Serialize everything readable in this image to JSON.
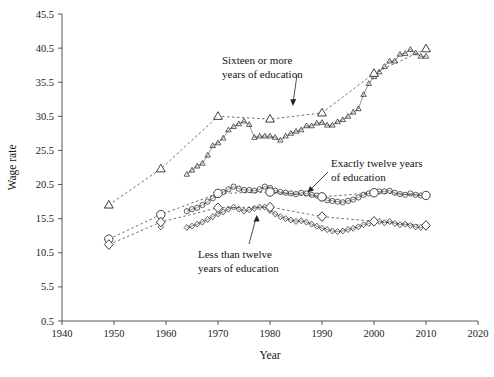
{
  "chart_data": {
    "type": "line",
    "title": "",
    "xlabel": "Year",
    "ylabel": "Wage rate",
    "xlim": [
      1940,
      2020
    ],
    "ylim": [
      0.5,
      45.5
    ],
    "xticks": [
      1940,
      1950,
      1960,
      1970,
      1980,
      1990,
      2000,
      2010,
      2020
    ],
    "yticks": [
      0.5,
      5.5,
      10.5,
      15.5,
      20.5,
      25.5,
      30.5,
      35.5,
      40.5,
      45.5
    ],
    "grid": false,
    "legend_position": "inline-annotations",
    "annotations": [
      {
        "name": "sixteen-or-more",
        "text_line1": "Sixteen or more",
        "text_line2": "years of education",
        "points_to": "triangle-series"
      },
      {
        "name": "exactly-twelve",
        "text_line1": "Exactly twelve years",
        "text_line2": "of education",
        "points_to": "circle-series"
      },
      {
        "name": "less-than-twelve",
        "text_line1": "Less than twelve",
        "text_line2": "years of education",
        "points_to": "diamond-series"
      }
    ],
    "series": [
      {
        "name": "Sixteen or more years of education",
        "marker": "triangle",
        "style": "dense-annual-with-decade-markers",
        "x": [
          1949,
          1959,
          1964,
          1965,
          1966,
          1967,
          1968,
          1969,
          1970,
          1971,
          1972,
          1973,
          1974,
          1975,
          1976,
          1977,
          1978,
          1979,
          1980,
          1981,
          1982,
          1983,
          1984,
          1985,
          1986,
          1987,
          1988,
          1989,
          1990,
          1991,
          1992,
          1993,
          1994,
          1995,
          1996,
          1997,
          1998,
          1999,
          2000,
          2001,
          2002,
          2003,
          2004,
          2005,
          2006,
          2007,
          2008,
          2009,
          2010
        ],
        "y": [
          17.5,
          22.7,
          22.0,
          22.6,
          23.2,
          23.6,
          24.8,
          26.2,
          26.6,
          27.3,
          28.5,
          29.0,
          29.4,
          29.8,
          29.3,
          27.4,
          27.6,
          27.6,
          27.6,
          27.4,
          27.0,
          27.6,
          28.0,
          28.3,
          28.5,
          29.1,
          29.1,
          29.5,
          29.6,
          29.2,
          29.2,
          29.7,
          30.0,
          30.5,
          31.1,
          31.6,
          33.7,
          35.3,
          36.3,
          37.0,
          37.8,
          38.6,
          38.6,
          39.6,
          39.7,
          40.3,
          39.8,
          39.3,
          39.3
        ],
        "decade_x": [
          1949,
          1959,
          1970,
          1980,
          1990,
          2000,
          2010
        ],
        "decade_y": [
          17.5,
          22.8,
          30.5,
          30.1,
          31.0,
          36.8,
          40.4
        ]
      },
      {
        "name": "Exactly twelve years of education",
        "marker": "circle",
        "style": "dense-annual-with-decade-markers",
        "x": [
          1949,
          1959,
          1964,
          1965,
          1966,
          1967,
          1968,
          1969,
          1970,
          1971,
          1972,
          1973,
          1974,
          1975,
          1976,
          1977,
          1978,
          1979,
          1980,
          1981,
          1982,
          1983,
          1984,
          1985,
          1986,
          1987,
          1988,
          1989,
          1990,
          1991,
          1992,
          1993,
          1994,
          1995,
          1996,
          1997,
          1998,
          1999,
          2000,
          2001,
          2002,
          2003,
          2004,
          2005,
          2006,
          2007,
          2008,
          2009,
          2010
        ],
        "y": [
          12.5,
          15.8,
          16.6,
          16.9,
          17.1,
          17.5,
          18.0,
          18.5,
          19.0,
          19.4,
          19.8,
          20.2,
          19.9,
          19.7,
          19.7,
          19.6,
          19.8,
          20.2,
          20.0,
          19.6,
          19.4,
          19.3,
          19.2,
          19.1,
          19.3,
          19.2,
          19.0,
          18.9,
          18.5,
          18.2,
          18.1,
          18.0,
          17.9,
          18.1,
          18.3,
          18.6,
          19.0,
          19.2,
          19.4,
          19.5,
          19.5,
          19.6,
          19.3,
          19.1,
          19.0,
          19.2,
          19.0,
          18.9,
          18.8
        ],
        "decade_x": [
          1949,
          1959,
          1970,
          1980,
          1990,
          2000,
          2010
        ],
        "decade_y": [
          12.5,
          16.1,
          19.2,
          19.4,
          18.7,
          19.3,
          18.9
        ]
      },
      {
        "name": "Less than twelve years of education",
        "marker": "diamond",
        "style": "dense-annual-with-decade-markers",
        "x": [
          1949,
          1959,
          1964,
          1965,
          1966,
          1967,
          1968,
          1969,
          1970,
          1971,
          1972,
          1973,
          1974,
          1975,
          1976,
          1977,
          1978,
          1979,
          1980,
          1981,
          1982,
          1983,
          1984,
          1985,
          1986,
          1987,
          1988,
          1989,
          1990,
          1991,
          1992,
          1993,
          1994,
          1995,
          1996,
          1997,
          1998,
          1999,
          2000,
          2001,
          2002,
          2003,
          2004,
          2005,
          2006,
          2007,
          2008,
          2009,
          2010
        ],
        "y": [
          11.8,
          14.3,
          14.2,
          14.4,
          14.7,
          15.0,
          15.4,
          15.8,
          16.2,
          16.5,
          16.9,
          17.2,
          16.9,
          16.6,
          16.8,
          17.0,
          17.2,
          17.2,
          16.7,
          16.2,
          15.8,
          15.5,
          15.3,
          15.1,
          15.2,
          15.0,
          14.7,
          14.4,
          14.1,
          13.9,
          13.7,
          13.6,
          13.7,
          13.9,
          14.1,
          14.3,
          14.6,
          14.8,
          15.0,
          15.1,
          14.9,
          15.1,
          14.8,
          14.6,
          14.7,
          14.5,
          14.3,
          14.2,
          14.3
        ],
        "decade_x": [
          1949,
          1959,
          1970,
          1980,
          1990,
          2000,
          2010
        ],
        "decade_y": [
          11.7,
          15.0,
          17.1,
          17.2,
          15.8,
          15.1,
          14.5
        ]
      }
    ]
  },
  "axes": {
    "xlabel": "Year",
    "ylabel": "Wage rate",
    "xtick_labels": [
      "1940",
      "1950",
      "1960",
      "1970",
      "1980",
      "1990",
      "2000",
      "2010",
      "2020"
    ],
    "ytick_labels": [
      "0.5",
      "5.5",
      "10.5",
      "15.5",
      "20.5",
      "25.5",
      "30.5",
      "35.5",
      "40.5",
      "45.5"
    ]
  },
  "colors": {
    "background": "#ffffff",
    "axis": "#555555",
    "marker_stroke": "#2a2a2a",
    "text": "#141414"
  },
  "labels": {
    "sixteen_line1": "Sixteen or more",
    "sixteen_line2": "years of education",
    "twelve_line1": "Exactly twelve years",
    "twelve_line2": "of education",
    "less_line1": "Less than twelve",
    "less_line2": "years of education"
  }
}
